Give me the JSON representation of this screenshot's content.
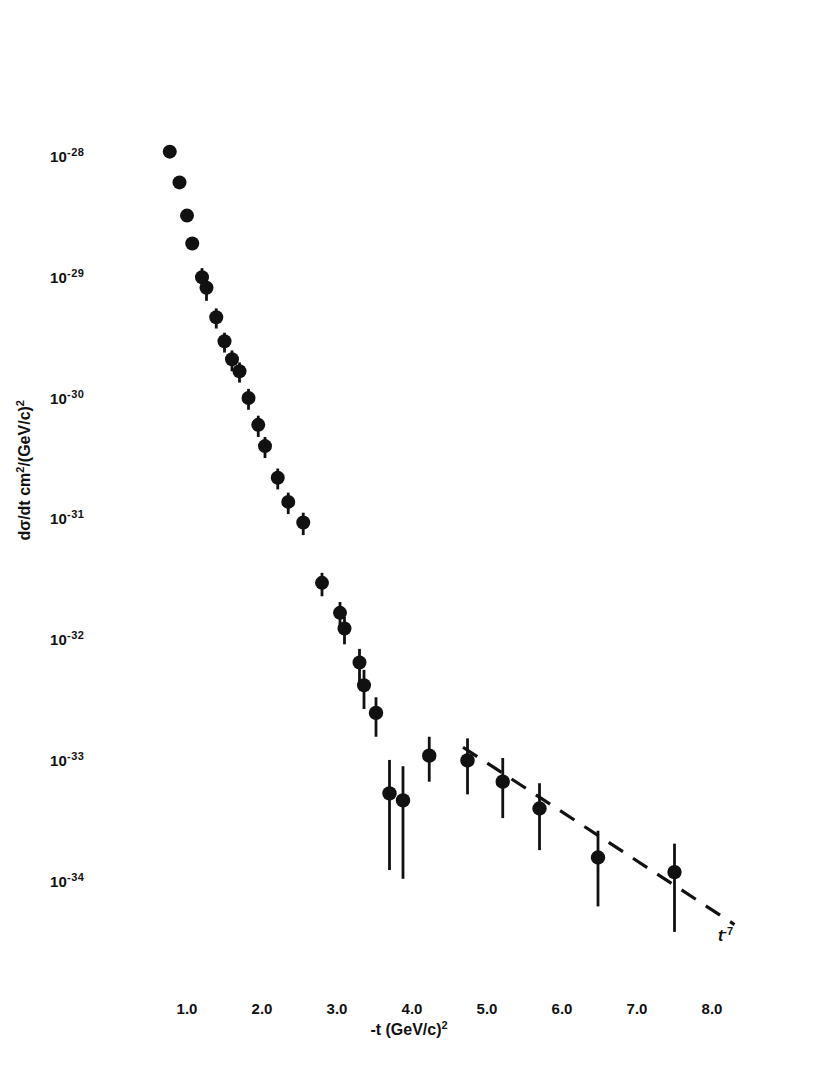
{
  "figure": {
    "background_color": "#ffffff",
    "ink_color": "#111111"
  },
  "axes": {
    "frame": {
      "left_px": 105,
      "right_px": 786,
      "top_px": 36,
      "bottom_px": 995
    },
    "x": {
      "title_main": "-t  (GeV/c)",
      "title_sup": "2",
      "tick_labels": [
        "1.0",
        "2.0",
        "3.0",
        "4.0",
        "5.0",
        "6.0",
        "7.0",
        "8.0"
      ],
      "tick_values": [
        1.0,
        2.0,
        3.0,
        4.0,
        5.0,
        6.0,
        7.0,
        8.0
      ],
      "range": [
        0.24,
        9.32
      ],
      "scale": "linear",
      "px_per_unit": 75,
      "px_at_one": 187
    },
    "y": {
      "title_main": "dσ/dt  cm",
      "title_sup1": "2",
      "title_mid": "/(GeV/c)",
      "title_sup2": "2",
      "tick_mantissa": "10",
      "tick_exponents": [
        "-28",
        "-29",
        "-30",
        "-31",
        "-32",
        "-33",
        "-34"
      ],
      "tick_values": [
        1e-28,
        1e-29,
        1e-30,
        1e-31,
        1e-32,
        1e-33,
        1e-34
      ],
      "range": [
        2.6e-35,
        3.5e-28
      ],
      "scale": "log",
      "px_per_decade": 120.8,
      "px_at_1e28": 159
    },
    "ticks_on_top": true,
    "ticks_on_right": true,
    "grid": false
  },
  "annotations": [
    {
      "name": "power-law-label",
      "text_main": "t",
      "text_sup": "-7",
      "x_px": 718,
      "y_px": 935
    }
  ],
  "chart_data": {
    "type": "scatter",
    "title": "",
    "subtitle": "",
    "xlabel": "-t (GeV/c)^2",
    "ylabel": "dσ/dt cm^2/(GeV/c)^2",
    "xlim": [
      0.24,
      9.32
    ],
    "ylim": [
      2.6e-35,
      3.5e-28
    ],
    "xscale": "linear",
    "yscale": "log",
    "grid": false,
    "legend": null,
    "marker": "filled-circle",
    "error_bars": "vertical",
    "series": [
      {
        "name": "dσ/dt measurement",
        "points": [
          {
            "x": 0.77,
            "y": 1.15e-28,
            "yerr_up": 0.0,
            "yerr_dn": 0.0
          },
          {
            "x": 0.9,
            "y": 6.4e-29,
            "yerr_up": 0.0,
            "yerr_dn": 0.0
          },
          {
            "x": 1.0,
            "y": 3.4e-29,
            "yerr_up": 0.0,
            "yerr_dn": 0.0
          },
          {
            "x": 1.07,
            "y": 2e-29,
            "yerr_up": 0.0,
            "yerr_dn": 0.0
          },
          {
            "x": 1.2,
            "y": 1.05e-29,
            "yerr_up": 2e-30,
            "yerr_dn": 1.8e-30
          },
          {
            "x": 1.26,
            "y": 8.6e-30,
            "yerr_up": 1.5e-30,
            "yerr_dn": 1.9e-30
          },
          {
            "x": 1.39,
            "y": 4.9e-30,
            "yerr_up": 9e-31,
            "yerr_dn": 9.5e-31
          },
          {
            "x": 1.5,
            "y": 3.1e-30,
            "yerr_up": 5.5e-31,
            "yerr_dn": 6e-31
          },
          {
            "x": 1.6,
            "y": 2.2e-30,
            "yerr_up": 4e-31,
            "yerr_dn": 4.5e-31
          },
          {
            "x": 1.7,
            "y": 1.75e-30,
            "yerr_up": 3.2e-31,
            "yerr_dn": 3.4e-31
          },
          {
            "x": 1.82,
            "y": 1.05e-30,
            "yerr_up": 2e-31,
            "yerr_dn": 2.1e-31
          },
          {
            "x": 1.95,
            "y": 6.3e-31,
            "yerr_up": 1.2e-31,
            "yerr_dn": 1.3e-31
          },
          {
            "x": 2.04,
            "y": 4.2e-31,
            "yerr_up": 8e-32,
            "yerr_dn": 8.5e-32
          },
          {
            "x": 2.21,
            "y": 2.3e-31,
            "yerr_up": 4.4e-32,
            "yerr_dn": 4.6e-32
          },
          {
            "x": 2.35,
            "y": 1.45e-31,
            "yerr_up": 2.8e-32,
            "yerr_dn": 3e-32
          },
          {
            "x": 2.55,
            "y": 9.8e-32,
            "yerr_up": 2e-32,
            "yerr_dn": 2.1e-32
          },
          {
            "x": 2.8,
            "y": 3.1e-32,
            "yerr_up": 6.5e-33,
            "yerr_dn": 7e-33
          },
          {
            "x": 3.04,
            "y": 1.75e-32,
            "yerr_up": 4e-33,
            "yerr_dn": 4.2e-33
          },
          {
            "x": 3.1,
            "y": 1.3e-32,
            "yerr_up": 3.2e-33,
            "yerr_dn": 3.4e-33
          },
          {
            "x": 3.3,
            "y": 6.8e-33,
            "yerr_up": 2e-33,
            "yerr_dn": 2.2e-33
          },
          {
            "x": 3.36,
            "y": 4.4e-33,
            "yerr_up": 1.5e-33,
            "yerr_dn": 1.6e-33
          },
          {
            "x": 3.52,
            "y": 2.6e-33,
            "yerr_up": 9e-34,
            "yerr_dn": 9.5e-34
          },
          {
            "x": 3.7,
            "y": 5.6e-34,
            "yerr_up": 5e-34,
            "yerr_dn": 4.3e-34
          },
          {
            "x": 3.88,
            "y": 4.9e-34,
            "yerr_up": 4.5e-34,
            "yerr_dn": 3.8e-34
          },
          {
            "x": 4.23,
            "y": 1.15e-33,
            "yerr_up": 5e-34,
            "yerr_dn": 4.5e-34
          },
          {
            "x": 4.74,
            "y": 1.05e-33,
            "yerr_up": 5.5e-34,
            "yerr_dn": 5e-34
          },
          {
            "x": 5.21,
            "y": 7e-34,
            "yerr_up": 4e-34,
            "yerr_dn": 3.5e-34
          },
          {
            "x": 5.7,
            "y": 4.2e-34,
            "yerr_up": 2.6e-34,
            "yerr_dn": 2.3e-34
          },
          {
            "x": 6.48,
            "y": 1.65e-34,
            "yerr_up": 1.1e-34,
            "yerr_dn": 1e-34
          },
          {
            "x": 7.5,
            "y": 1.25e-34,
            "yerr_up": 9e-35,
            "yerr_dn": 8.5e-35
          }
        ]
      }
    ],
    "fit_curve": {
      "name": "t^-7 power law",
      "style": "dashed",
      "label_main": "t",
      "label_sup": "-7",
      "x_start": 4.68,
      "x_end": 8.3,
      "y_start": 1.35e-33,
      "y_end": 4.6e-35
    }
  }
}
